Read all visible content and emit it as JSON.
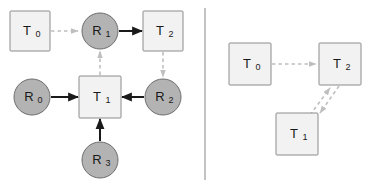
{
  "figure": {
    "panels": [
      {
        "id": "resource-allocation-graph",
        "name": "left-panel",
        "nodes": [
          {
            "id": "T0",
            "kind": "task",
            "shape": "square",
            "base": "T",
            "sub": "0",
            "cx": 30,
            "cy": 31,
            "size": 40
          },
          {
            "id": "R1",
            "kind": "resource",
            "shape": "circle",
            "base": "R",
            "sub": "1",
            "cx": 100,
            "cy": 31,
            "size": 36
          },
          {
            "id": "T2",
            "kind": "task",
            "shape": "square",
            "base": "T",
            "sub": "2",
            "cx": 163,
            "cy": 31,
            "size": 40
          },
          {
            "id": "R0",
            "kind": "resource",
            "shape": "circle",
            "base": "R",
            "sub": "0",
            "cx": 32,
            "cy": 97,
            "size": 36
          },
          {
            "id": "T1",
            "kind": "task",
            "shape": "square",
            "base": "T",
            "sub": "1",
            "cx": 100,
            "cy": 97,
            "size": 42
          },
          {
            "id": "R2",
            "kind": "resource",
            "shape": "circle",
            "base": "R",
            "sub": "2",
            "cx": 163,
            "cy": 97,
            "size": 36
          },
          {
            "id": "R3",
            "kind": "resource",
            "shape": "circle",
            "base": "R",
            "sub": "3",
            "cx": 100,
            "cy": 160,
            "size": 36
          }
        ],
        "edges": [
          {
            "from": "T0",
            "to": "R1",
            "style": "dashed",
            "label": "request"
          },
          {
            "from": "R1",
            "to": "T2",
            "style": "solid",
            "label": "assignment"
          },
          {
            "from": "T2",
            "to": "R2",
            "style": "dashed",
            "label": "request"
          },
          {
            "from": "R2",
            "to": "T1",
            "style": "solid",
            "label": "assignment"
          },
          {
            "from": "R0",
            "to": "T1",
            "style": "solid",
            "label": "assignment"
          },
          {
            "from": "R3",
            "to": "T1",
            "style": "solid",
            "label": "assignment"
          },
          {
            "from": "T1",
            "to": "R1",
            "style": "dashed",
            "label": "request"
          }
        ]
      },
      {
        "id": "wait-for-graph",
        "name": "right-panel",
        "nodes": [
          {
            "id": "T0",
            "kind": "task",
            "shape": "square",
            "base": "T",
            "sub": "0",
            "cx": 250,
            "cy": 64,
            "size": 42
          },
          {
            "id": "T2",
            "kind": "task",
            "shape": "square",
            "base": "T",
            "sub": "2",
            "cx": 340,
            "cy": 64,
            "size": 42
          },
          {
            "id": "T1",
            "kind": "task",
            "shape": "square",
            "base": "T",
            "sub": "1",
            "cx": 297,
            "cy": 134,
            "size": 42
          }
        ],
        "edges": [
          {
            "from": "T0",
            "to": "T2",
            "style": "dashed",
            "label": "waits-for"
          },
          {
            "from": "T1",
            "to": "T2",
            "style": "dashed",
            "label": "waits-for"
          },
          {
            "from": "T2",
            "to": "T1",
            "style": "dashed",
            "label": "waits-for"
          }
        ]
      }
    ],
    "divider": {
      "x": 205,
      "y1": 8,
      "y2": 180
    },
    "colors": {
      "task_fill": "#f2f2f2",
      "task_stroke": "#8c8c8c",
      "resource_fill": "#b3b3b3",
      "resource_stroke": "#6e6e6e",
      "solid_edge": "#1a1a1a",
      "dashed_edge": "#bfbfbf",
      "background": "#ffffff",
      "divider": "#aaaaaa"
    }
  }
}
